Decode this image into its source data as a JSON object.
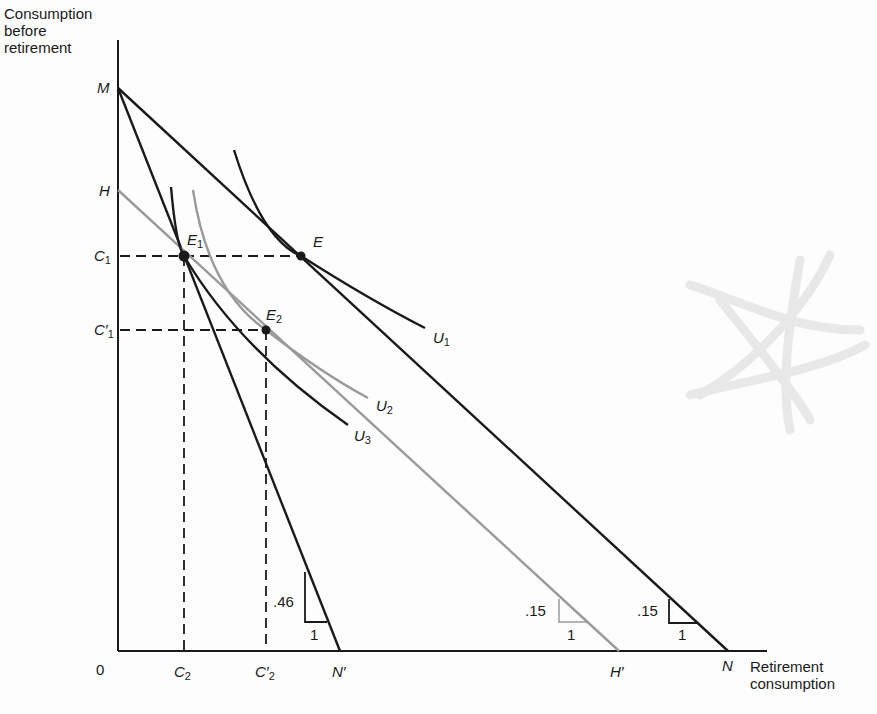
{
  "diagram": {
    "y_axis_title": [
      "Consumption",
      "before",
      "retirement"
    ],
    "x_axis_title": [
      "Retirement",
      "consumption"
    ],
    "origin_label": "0",
    "y_points": [
      {
        "id": "M",
        "label": "M",
        "y": 88
      },
      {
        "id": "H",
        "label": "H",
        "y": 190
      },
      {
        "id": "C1",
        "label": "C",
        "sub": "1",
        "prime": "",
        "y": 256
      },
      {
        "id": "C1p",
        "label": "C",
        "sub": "1",
        "prime": "′",
        "y": 330
      }
    ],
    "x_points": [
      {
        "id": "C2",
        "label": "C",
        "sub": "2",
        "prime": "",
        "x": 184
      },
      {
        "id": "C2p",
        "label": "C",
        "sub": "2",
        "prime": "′",
        "x": 266
      },
      {
        "id": "Np",
        "label": "N′",
        "x": 340
      },
      {
        "id": "Hp",
        "label": "H′",
        "x": 619
      },
      {
        "id": "N",
        "label": "N",
        "x": 728
      }
    ],
    "budget_lines": [
      {
        "id": "MN",
        "from": "M",
        "to": "N",
        "color": "#1a1a1a",
        "slope_label": ".15",
        "run_label": "1"
      },
      {
        "id": "MNp",
        "from": "M",
        "to": "N′",
        "color": "#1a1a1a",
        "slope_label": ".46",
        "run_label": "1"
      },
      {
        "id": "HHp",
        "from": "H",
        "to": "H′",
        "color": "#9a9a9a",
        "slope_label": ".15",
        "run_label": "1"
      }
    ],
    "equilibria": [
      {
        "id": "E",
        "label": "E",
        "sub": ""
      },
      {
        "id": "E1",
        "label": "E",
        "sub": "1"
      },
      {
        "id": "E2",
        "label": "E",
        "sub": "2"
      }
    ],
    "indifference_curves": [
      {
        "id": "U1",
        "label": "U",
        "sub": "1",
        "color": "#1a1a1a"
      },
      {
        "id": "U2",
        "label": "U",
        "sub": "2",
        "color": "#9a9a9a"
      },
      {
        "id": "U3",
        "label": "U",
        "sub": "3",
        "color": "#1a1a1a"
      }
    ],
    "colors": {
      "ink": "#1a1a1a",
      "gray_line": "#9a9a9a",
      "background": "#fdfdfd",
      "smudge": "#e6e6e6"
    }
  }
}
